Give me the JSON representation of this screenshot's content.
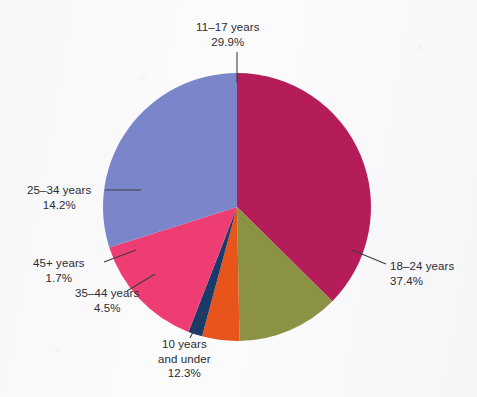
{
  "chart_data": {
    "type": "pie",
    "title": "",
    "subtitle": "",
    "xlabel": "",
    "ylabel": "",
    "legend_position": "none",
    "grid": false,
    "units": "percent",
    "total": "100.0%",
    "start_angle_deg": 0,
    "direction": "clockwise",
    "categories": [
      "18–24 years",
      "10 years and under",
      "35–44 years",
      "45+ years",
      "25–34 years",
      "11–17 years"
    ],
    "values": [
      37.4,
      12.3,
      4.5,
      1.7,
      14.2,
      29.9
    ],
    "colors": [
      "#b41d5a",
      "#8b9243",
      "#e8551b",
      "#1a3a6b",
      "#ee3d73",
      "#7b85ca"
    ],
    "slices": [
      {
        "id": "18-24",
        "category": "18–24 years",
        "value": 37.4,
        "percent_text": "37.4%",
        "color": "#b41d5a",
        "color_name": "crimson"
      },
      {
        "id": "10-under",
        "category": "10 years and under",
        "category_line1": "10 years",
        "category_line2": "and under",
        "value": 12.3,
        "percent_text": "12.3%",
        "color": "#8b9243",
        "color_name": "olive"
      },
      {
        "id": "35-44",
        "category": "35–44 years",
        "value": 4.5,
        "percent_text": "4.5%",
        "color": "#e8551b",
        "color_name": "orange"
      },
      {
        "id": "45-plus",
        "category": "45+ years",
        "value": 1.7,
        "percent_text": "1.7%",
        "color": "#1a3a6b",
        "color_name": "navy"
      },
      {
        "id": "25-34",
        "category": "25–34 years",
        "value": 14.2,
        "percent_text": "14.2%",
        "color": "#ee3d73",
        "color_name": "pink"
      },
      {
        "id": "11-17",
        "category": "11–17 years",
        "value": 29.9,
        "percent_text": "29.9%",
        "color": "#7b85ca",
        "color_name": "blue-violet"
      }
    ]
  },
  "labels": {
    "l11_17": {
      "name": "11–17 years",
      "pct": "29.9%"
    },
    "l18_24": {
      "name": "18–24 years",
      "pct": "37.4%"
    },
    "l10under": {
      "line1": "10 years",
      "line2": "and under",
      "pct": "12.3%"
    },
    "l35_44": {
      "name": "35–44 years",
      "pct": "4.5%"
    },
    "l45plus": {
      "name": "45+ years",
      "pct": "1.7%"
    },
    "l25_34": {
      "name": "25–34 years",
      "pct": "14.2%"
    }
  },
  "style": {
    "background": "#fbfbfc",
    "text_color": "#2b2b2f",
    "leader_line_color": "#3c3c42"
  }
}
